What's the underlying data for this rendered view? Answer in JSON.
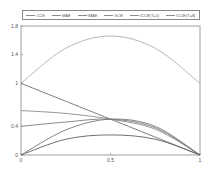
{
  "chart_data": {
    "type": "line",
    "title": "",
    "xlabel": "",
    "ylabel": "",
    "xlim": [
      0,
      1
    ],
    "ylim": [
      0,
      1.8
    ],
    "x_ticks": [
      "0",
      "0.5",
      "1"
    ],
    "y_ticks": [
      "0",
      "0.4",
      "1",
      "1.4",
      "1.8"
    ],
    "grid": false,
    "legend_position": "top (above plot)",
    "legend_labels": [
      "CCE",
      "MAE",
      "IMAE",
      "GCE",
      "ICCE(T=1)",
      "ICCE(T=8)"
    ],
    "legend_to_curve_mapping": "not determinable from image — all curves and legend swatches are rendered in near-identical gray with no distinguishing dash pattern or color",
    "series": [
      {
        "id": "curve-a",
        "description": "hump: rises from 1 to ~1.66 at x=0.5, returns to 1 at x=1",
        "points": [
          [
            0,
            1.0
          ],
          [
            0.25,
            1.49
          ],
          [
            0.5,
            1.66
          ],
          [
            0.75,
            1.49
          ],
          [
            1,
            1.0
          ]
        ]
      },
      {
        "id": "curve-b",
        "description": "straight line from 1 at x=0 to 0 at x=1",
        "points": [
          [
            0,
            1.0
          ],
          [
            0.5,
            0.5
          ],
          [
            1,
            0.0
          ]
        ]
      },
      {
        "id": "curve-c",
        "description": "starts ~0.62, nearly flat to ~0.5 at x=0.5, then falls to 0",
        "points": [
          [
            0,
            0.62
          ],
          [
            0.25,
            0.58
          ],
          [
            0.5,
            0.5
          ],
          [
            0.75,
            0.36
          ],
          [
            1,
            0.0
          ]
        ]
      },
      {
        "id": "curve-d",
        "description": "starts ~0.4, rises to ~0.5 at x=0.5, then falls to 0",
        "points": [
          [
            0,
            0.4
          ],
          [
            0.25,
            0.46
          ],
          [
            0.5,
            0.5
          ],
          [
            0.75,
            0.38
          ],
          [
            1,
            0.0
          ]
        ]
      },
      {
        "id": "curve-e",
        "description": "starts at 0, rises to ~0.5 at x=0.5, then falls to 0",
        "points": [
          [
            0,
            0.0
          ],
          [
            0.25,
            0.35
          ],
          [
            0.5,
            0.5
          ],
          [
            0.75,
            0.4
          ],
          [
            1,
            0.0
          ]
        ]
      },
      {
        "id": "curve-f",
        "description": "lowest curve: starts at 0, rises to ~0.28 near x=0.5, then falls to 0",
        "points": [
          [
            0,
            0.0
          ],
          [
            0.25,
            0.22
          ],
          [
            0.5,
            0.28
          ],
          [
            0.75,
            0.22
          ],
          [
            1,
            0.0
          ]
        ]
      }
    ]
  }
}
